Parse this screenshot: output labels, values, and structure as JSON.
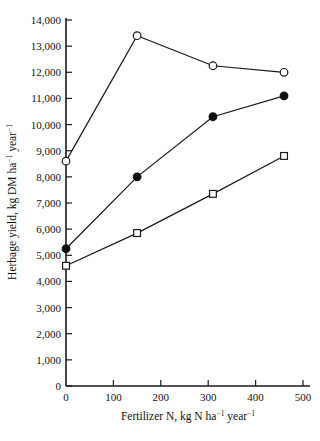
{
  "chart_data": {
    "type": "line",
    "title": "",
    "xlabel": "Fertilizer N, kg N ha⁻¹ year⁻¹",
    "ylabel": "Herbage yield, kg DM ha⁻¹ year⁻¹",
    "xlim": [
      0,
      500
    ],
    "ylim": [
      0,
      14000
    ],
    "xticks": [
      0,
      100,
      200,
      300,
      400,
      500
    ],
    "xtick_labels": [
      "0",
      "100",
      "200",
      "300",
      "400",
      "500"
    ],
    "yticks": [
      0,
      1000,
      2000,
      3000,
      4000,
      5000,
      6000,
      7000,
      8000,
      9000,
      10000,
      11000,
      12000,
      13000,
      14000
    ],
    "ytick_labels": [
      "0",
      "1,000",
      "2,000",
      "3,000",
      "4,000",
      "5,000",
      "6,000",
      "7,000",
      "8,000",
      "9,000",
      "10,000",
      "11,000",
      "12,000",
      "13,000",
      "14,000"
    ],
    "grid": false,
    "legend": "none",
    "x": [
      0,
      150,
      310,
      460
    ],
    "series": [
      {
        "name": "open-circle-series",
        "marker": "open-circle",
        "color": "#1a1a1a",
        "values": [
          8600,
          13400,
          12250,
          12000
        ]
      },
      {
        "name": "filled-circle-series",
        "marker": "filled-circle",
        "color": "#101010",
        "values": [
          5250,
          8000,
          10300,
          11100
        ]
      },
      {
        "name": "open-square-series",
        "marker": "open-square",
        "color": "#1a1a1a",
        "values": [
          4600,
          5850,
          7350,
          8800
        ]
      }
    ]
  },
  "axis_labels": {
    "x_parts": {
      "main": "Fertilizer N, kg N ha",
      "sup1": "−1",
      "mid": " year",
      "sup2": "−1"
    },
    "y_parts": {
      "main": "Herbage yield, kg DM ha",
      "sup1": "−1",
      "mid": " year",
      "sup2": "−1"
    }
  }
}
